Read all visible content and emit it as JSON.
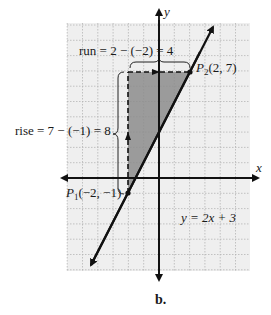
{
  "figure": {
    "caption": "b.",
    "equation_label": "y = 2x + 3",
    "axes": {
      "x_label": "x",
      "y_label": "y"
    },
    "points": {
      "p1": {
        "name": "P",
        "subscript": "1",
        "coords": "(−2, −1)",
        "x": -2,
        "y": -1
      },
      "p2": {
        "name": "P",
        "subscript": "2",
        "coords": "(2, 7)",
        "x": 2,
        "y": 7
      }
    },
    "run_label": "run = 2 − (−2) = 4",
    "rise_label": "rise = 7 − (−1) = 8",
    "line": {
      "slope": 2,
      "intercept": 3
    },
    "grid": {
      "x_range": [
        -6,
        6
      ],
      "y_range": [
        -6,
        10
      ],
      "spacing_units": 1
    },
    "colors": {
      "grid_bg": "#efefef",
      "grid_line": "#b8b8b8",
      "axis": "#111111",
      "shade": "#8c8c8c",
      "line": "#111111"
    }
  }
}
